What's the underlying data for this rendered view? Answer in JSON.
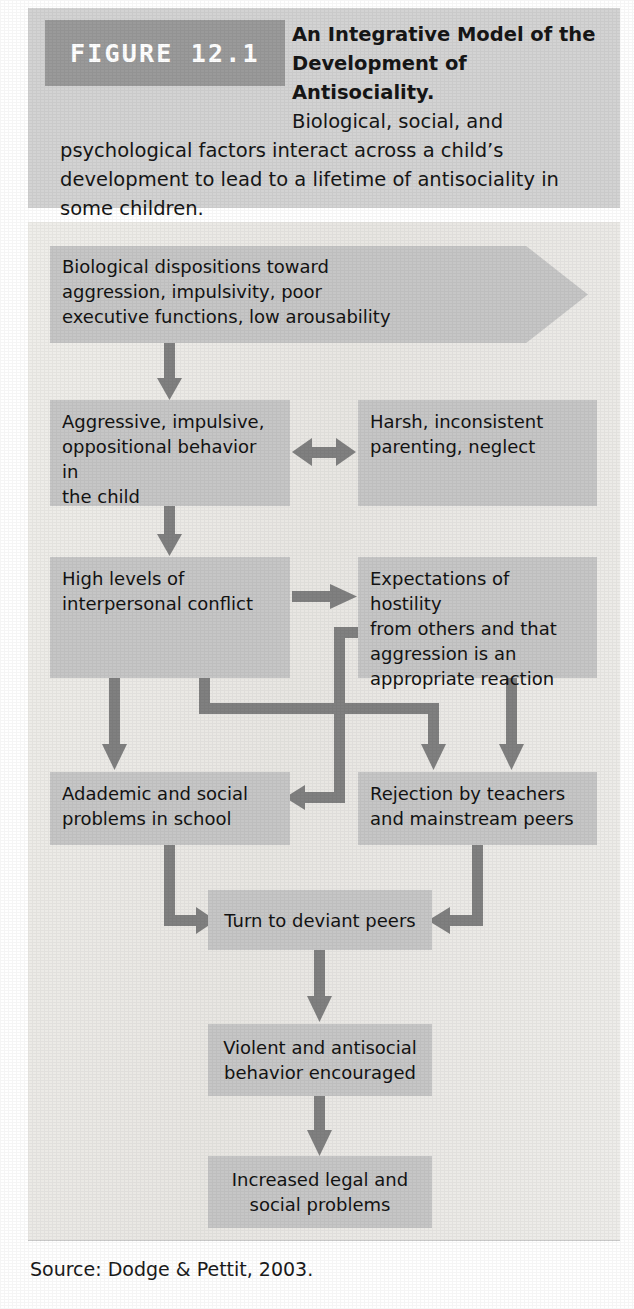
{
  "figure": {
    "badge_label": "FIGURE 12.1",
    "title_line1": "An Integrative Model of the",
    "title_line2": "Development of Antisociality.",
    "caption_line3": "Biological, social, and",
    "caption_rest": "psychological factors interact across a child’s development to lead to a lifetime of antisociality in some children.",
    "source": "Source: Dodge & Pettit, 2003."
  },
  "colors": {
    "header_band": "#d3d3d3",
    "badge_bg": "#9a9a9a",
    "badge_text": "#ffffff",
    "panel_bg": "#eceae6",
    "node_bg": "#c6c6c6",
    "arrow": "#808080",
    "text": "#131313"
  },
  "chart_data": {
    "type": "diagram",
    "title": "An Integrative Model of the Development of Antisociality.",
    "nodes": [
      {
        "id": "n1",
        "label": "Biological dispositions toward aggression, impulsivity, poor executive functions, low arousability",
        "shape": "arrow-banner"
      },
      {
        "id": "n2",
        "label": "Aggressive, impulsive, oppositional behavior in the child",
        "shape": "rect"
      },
      {
        "id": "n3",
        "label": "Harsh, inconsistent parenting, neglect",
        "shape": "rect"
      },
      {
        "id": "n4",
        "label": "High levels of interpersonal conflict",
        "shape": "rect"
      },
      {
        "id": "n5",
        "label": "Expectations of hostility from others and that aggression is an appropriate reaction",
        "shape": "rect"
      },
      {
        "id": "n6",
        "label": "Adademic and social problems in school",
        "shape": "rect"
      },
      {
        "id": "n7",
        "label": "Rejection by teachers and mainstream peers",
        "shape": "rect"
      },
      {
        "id": "n8",
        "label": "Turn to deviant peers",
        "shape": "rect"
      },
      {
        "id": "n9",
        "label": "Violent and antisocial behavior encouraged",
        "shape": "rect"
      },
      {
        "id": "n10",
        "label": "Increased legal and social problems",
        "shape": "rect"
      }
    ],
    "edges": [
      {
        "from": "n1",
        "to": "n2",
        "style": "straight-down"
      },
      {
        "from": "n2",
        "to": "n3",
        "style": "bidirectional-horizontal"
      },
      {
        "from": "n2",
        "to": "n4",
        "style": "straight-down"
      },
      {
        "from": "n4",
        "to": "n5",
        "style": "straight-right"
      },
      {
        "from": "n4",
        "to": "n6",
        "style": "straight-down"
      },
      {
        "from": "n4",
        "to": "n7",
        "style": "elbow-down-right-down"
      },
      {
        "from": "n5",
        "to": "n6",
        "style": "elbow-left-down-left"
      },
      {
        "from": "n5",
        "to": "n7",
        "style": "straight-down"
      },
      {
        "from": "n6",
        "to": "n8",
        "style": "elbow-down-right"
      },
      {
        "from": "n7",
        "to": "n8",
        "style": "elbow-down-left"
      },
      {
        "from": "n8",
        "to": "n9",
        "style": "straight-down"
      },
      {
        "from": "n9",
        "to": "n10",
        "style": "straight-down"
      }
    ]
  },
  "nodes": {
    "n1": "Biological dispositions toward\naggression, impulsivity, poor\nexecutive functions, low arousability",
    "n2": "Aggressive, impulsive,\noppositional behavior in\nthe child",
    "n3": "Harsh, inconsistent\nparenting, neglect",
    "n4": "High levels of\ninterpersonal conflict",
    "n5": "Expectations of hostility\nfrom others and that\naggression is an\nappropriate reaction",
    "n6": "Adademic and social\nproblems in school",
    "n7": "Rejection by teachers\nand mainstream peers",
    "n8": "Turn to deviant peers",
    "n9": "Violent and antisocial\nbehavior encouraged",
    "n10": "Increased legal and\nsocial problems"
  }
}
